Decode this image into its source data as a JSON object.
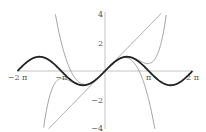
{
  "chart_data": {
    "type": "line",
    "title": "",
    "xlabel": "",
    "ylabel": "",
    "xlim": [
      -6.2832,
      6.2832
    ],
    "ylim": [
      -4,
      4
    ],
    "grid": false,
    "legend": null,
    "x_ticks": [
      {
        "value": -6.2832,
        "label": "−2 π"
      },
      {
        "value": -3.1416,
        "label": "−π"
      },
      {
        "value": 3.1416,
        "label": "π"
      },
      {
        "value": 6.2832,
        "label": "2 π"
      }
    ],
    "y_ticks": [
      {
        "value": 4,
        "label": "4"
      },
      {
        "value": 2,
        "label": "2"
      },
      {
        "value": -2,
        "label": "−2"
      },
      {
        "value": -4,
        "label": "−4"
      }
    ],
    "series": [
      {
        "name": "sin(x)",
        "expr": "sin",
        "color": "#222222",
        "width": 1.8
      },
      {
        "name": "x",
        "expr": "p1",
        "color": "#888888",
        "width": 0.8
      },
      {
        "name": "x - x^3/6",
        "expr": "p3",
        "color": "#888888",
        "width": 0.8
      },
      {
        "name": "x - x^3/6 + x^5/120",
        "expr": "p5",
        "color": "#888888",
        "width": 0.8
      }
    ]
  }
}
